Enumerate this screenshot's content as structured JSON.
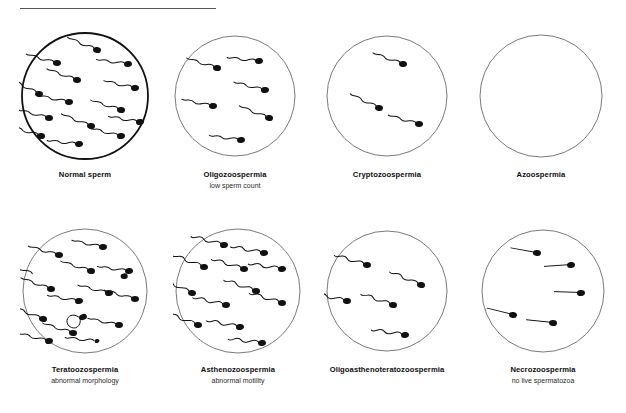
{
  "figure": {
    "title_rule": true,
    "background": "#ffffff",
    "ink_color": "#111111",
    "circle_stroke_normal": "#6b6b6b",
    "circle_stroke_emphasis": "#111111"
  },
  "panels": [
    {
      "id": "normal-sperm",
      "label": "Normal sperm",
      "sublabel": "",
      "sperm_count": 14,
      "emphasis_border": true,
      "morphology": "normal",
      "tail": "wavy",
      "cx": 85,
      "cy": 96,
      "r": 63
    },
    {
      "id": "oligozoospermia",
      "label": "Oligozoospermia",
      "sublabel": "low sperm count",
      "sperm_count": 6,
      "emphasis_border": false,
      "morphology": "normal",
      "tail": "wavy",
      "cx": 235,
      "cy": 96,
      "r": 60
    },
    {
      "id": "cryptozoospermia",
      "label": "Cryptozoospermia",
      "sublabel": "",
      "sperm_count": 3,
      "emphasis_border": false,
      "morphology": "normal",
      "tail": "wavy",
      "cx": 387,
      "cy": 96,
      "r": 60
    },
    {
      "id": "azoospermia",
      "label": "Azoospermia",
      "sublabel": "",
      "sperm_count": 0,
      "emphasis_border": false,
      "morphology": "none",
      "tail": "none",
      "cx": 541,
      "cy": 96,
      "r": 61
    },
    {
      "id": "teratoozospermia",
      "label": "Teratoozospermia",
      "sublabel": "abnormal morphology",
      "sperm_count": 15,
      "emphasis_border": false,
      "morphology": "abnormal",
      "tail": "wavy",
      "cx": 85,
      "cy": 291,
      "r": 62
    },
    {
      "id": "asthenozoospermia",
      "label": "Asthenozoospermia",
      "sublabel": "abnormal motility",
      "sperm_count": 12,
      "emphasis_border": false,
      "morphology": "normal",
      "tail": "coiled",
      "cx": 238,
      "cy": 291,
      "r": 62
    },
    {
      "id": "oligoasthenoteratozoospermia",
      "label": "Oligoasthenoteratozoospermia",
      "sublabel": "",
      "sperm_count": 5,
      "emphasis_border": false,
      "morphology": "abnormal",
      "tail": "coiled",
      "cx": 387,
      "cy": 291,
      "r": 60
    },
    {
      "id": "necrozoospermia",
      "label": "Necrozoospermia",
      "sublabel": "no live spermatozoa",
      "sperm_count": 5,
      "emphasis_border": false,
      "morphology": "dead",
      "tail": "straight",
      "cx": 543,
      "cy": 291,
      "r": 61
    }
  ],
  "sperm_layouts": {
    "normal-sperm": [
      {
        "x": 12,
        "y": -46,
        "a": 25
      },
      {
        "x": -28,
        "y": -33,
        "a": 18
      },
      {
        "x": 43,
        "y": -32,
        "a": 10
      },
      {
        "x": -8,
        "y": -16,
        "a": 22
      },
      {
        "x": 50,
        "y": -8,
        "a": 15
      },
      {
        "x": -46,
        "y": -2,
        "a": 30
      },
      {
        "x": -16,
        "y": 6,
        "a": 14
      },
      {
        "x": 36,
        "y": 14,
        "a": 20
      },
      {
        "x": -36,
        "y": 22,
        "a": 17
      },
      {
        "x": 55,
        "y": 26,
        "a": 12
      },
      {
        "x": 6,
        "y": 30,
        "a": 24
      },
      {
        "x": 36,
        "y": 40,
        "a": 16
      },
      {
        "x": -6,
        "y": 48,
        "a": 8
      },
      {
        "x": -44,
        "y": 40,
        "a": 20
      }
    ],
    "oligozoospermia": [
      {
        "x": -18,
        "y": -28,
        "a": 20
      },
      {
        "x": 24,
        "y": -35,
        "a": 8
      },
      {
        "x": 30,
        "y": -6,
        "a": 16
      },
      {
        "x": -22,
        "y": 10,
        "a": 14
      },
      {
        "x": 34,
        "y": 22,
        "a": 24
      },
      {
        "x": 6,
        "y": 44,
        "a": 10
      }
    ],
    "cryptozoospermia": [
      {
        "x": 16,
        "y": -32,
        "a": 22
      },
      {
        "x": -8,
        "y": 12,
        "a": 28
      },
      {
        "x": 32,
        "y": 28,
        "a": 18
      }
    ],
    "azoospermia": [],
    "teratoozospermia": [
      {
        "x": -26,
        "y": -36,
        "a": 18,
        "type": "normal"
      },
      {
        "x": 18,
        "y": -44,
        "a": 14,
        "type": "normal"
      },
      {
        "x": -50,
        "y": -16,
        "a": 26,
        "type": "headless"
      },
      {
        "x": 6,
        "y": -20,
        "a": 20,
        "type": "normal"
      },
      {
        "x": 44,
        "y": -20,
        "a": 10,
        "type": "double-head"
      },
      {
        "x": -34,
        "y": -2,
        "a": 22,
        "type": "normal"
      },
      {
        "x": 24,
        "y": 2,
        "a": 16,
        "type": "normal"
      },
      {
        "x": -6,
        "y": 10,
        "a": 12,
        "type": "normal"
      },
      {
        "x": 50,
        "y": 8,
        "a": 18,
        "type": "normal"
      },
      {
        "x": -2,
        "y": 26,
        "a": 0,
        "type": "coiled-tail"
      },
      {
        "x": -42,
        "y": 28,
        "a": 24,
        "type": "normal"
      },
      {
        "x": 34,
        "y": 34,
        "a": 14,
        "type": "normal"
      },
      {
        "x": -12,
        "y": 42,
        "a": 20,
        "type": "normal"
      },
      {
        "x": 12,
        "y": 50,
        "a": 8,
        "type": "pinhead"
      },
      {
        "x": -36,
        "y": 50,
        "a": 16,
        "type": "normal"
      }
    ],
    "asthenozoospermia": [
      {
        "x": -14,
        "y": -46,
        "a": 16
      },
      {
        "x": 26,
        "y": -38,
        "a": 12
      },
      {
        "x": -34,
        "y": -24,
        "a": 22
      },
      {
        "x": 6,
        "y": -22,
        "a": 18
      },
      {
        "x": 44,
        "y": -22,
        "a": 10
      },
      {
        "x": -46,
        "y": 2,
        "a": 26
      },
      {
        "x": 18,
        "y": 0,
        "a": 20
      },
      {
        "x": -12,
        "y": 14,
        "a": 14
      },
      {
        "x": 44,
        "y": 12,
        "a": 18
      },
      {
        "x": -40,
        "y": 34,
        "a": 22
      },
      {
        "x": 2,
        "y": 36,
        "a": 12
      },
      {
        "x": 24,
        "y": 52,
        "a": 8
      }
    ],
    "oligoasthenoteratozoospermia": [
      {
        "x": -20,
        "y": -26,
        "a": 18
      },
      {
        "x": 34,
        "y": -6,
        "a": 24
      },
      {
        "x": -40,
        "y": 10,
        "a": 14
      },
      {
        "x": 6,
        "y": 14,
        "a": 20
      },
      {
        "x": 18,
        "y": 44,
        "a": 10
      }
    ],
    "necrozoospermia": [
      {
        "x": -6,
        "y": -38,
        "a": 24
      },
      {
        "x": 28,
        "y": -26,
        "a": 10
      },
      {
        "x": 38,
        "y": 2,
        "a": 16
      },
      {
        "x": -30,
        "y": 24,
        "a": 28
      },
      {
        "x": 10,
        "y": 32,
        "a": 20
      }
    ]
  }
}
